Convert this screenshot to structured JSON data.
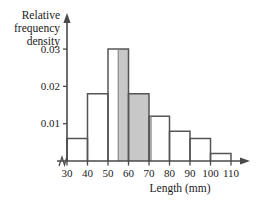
{
  "chart_data": {
    "type": "bar",
    "title": "",
    "subtitle": "",
    "xlabel": "Length (mm)",
    "ylabel": "Relative frequency density",
    "ylabel_lines": [
      "Relative",
      "frequency",
      "density"
    ],
    "categories": [
      "30-40",
      "40-50",
      "50-60",
      "60-70",
      "70-80",
      "80-90",
      "90-100",
      "100-110"
    ],
    "bin_edges": [
      30,
      40,
      50,
      60,
      70,
      80,
      90,
      100,
      110
    ],
    "values": [
      0.006,
      0.018,
      0.03,
      0.018,
      0.012,
      0.008,
      0.006,
      0.002
    ],
    "xtick_labels": [
      "30",
      "40",
      "50",
      "60",
      "70",
      "80",
      "90",
      "100",
      "110"
    ],
    "xtick_values": [
      30,
      40,
      50,
      60,
      70,
      80,
      90,
      100,
      110
    ],
    "ytick_labels": [
      "0.01",
      "0.02",
      "0.03"
    ],
    "ytick_values": [
      0.01,
      0.02,
      0.03
    ],
    "xlim": [
      30,
      110
    ],
    "ylim": [
      0,
      0.0335
    ],
    "grid": false,
    "legend": null,
    "axis_break_x": true,
    "shaded_region": {
      "x_start": 55,
      "x_end": 71,
      "color": "#c8c8c8"
    },
    "colors": {
      "bar_fill": "#ffffff",
      "bar_stroke": "#555555",
      "shade_fill": "#c8c8c8",
      "axis": "#4a4a4a",
      "text": "#1a1a1a"
    }
  }
}
